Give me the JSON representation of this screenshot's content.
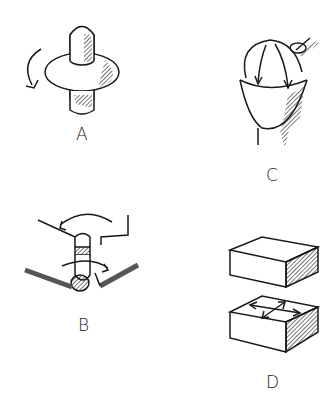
{
  "figures": [
    {
      "id": "A",
      "label": "A",
      "description": "peg with ring rotating around axis"
    },
    {
      "id": "B",
      "label": "B",
      "description": "pin hinge with rotating arrow through slot"
    },
    {
      "id": "C",
      "label": "C",
      "description": "ball in socket with arrows"
    },
    {
      "id": "D",
      "label": "D",
      "description": "two stacked blocks, lower with planar arrows"
    }
  ],
  "colors": {
    "ink": "#1a1a1a",
    "background": "#ffffff"
  }
}
